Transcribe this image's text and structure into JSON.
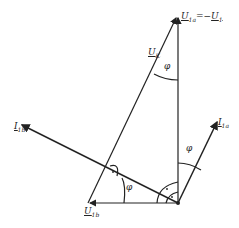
{
  "diagram": {
    "type": "phasor-diagram",
    "labels": {
      "u1a_eq": "U1a = -U1",
      "u1a_main": "U",
      "u1a_sub": "1a",
      "u1_main": "U",
      "u1_sub": "1",
      "uk_main": "U",
      "uk_sub": "K",
      "i1b_main": "I",
      "i1b_sub": "1b",
      "i1a_main": "I",
      "i1a_sub": "1a",
      "u1b_main": "U",
      "u1b_sub": "1b",
      "phi_top": "φ",
      "phi_right": "φ",
      "phi_bottom": "φ"
    },
    "colors": {
      "stroke": "#222222",
      "background": "#ffffff"
    }
  }
}
